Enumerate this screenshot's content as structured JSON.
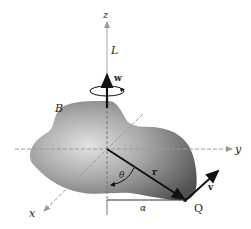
{
  "diagram": {
    "title": "",
    "body_label": "B",
    "axes": {
      "x": "x",
      "y": "y",
      "z": "z"
    },
    "vectors": {
      "angular_momentum": "L",
      "angular_velocity": "w",
      "position": "r",
      "velocity": "v"
    },
    "point_label": "Q",
    "angle_label": "θ",
    "distance_label": "α",
    "colors": {
      "body_dark": "#5a5a5a",
      "body_light": "#d8d8d8",
      "axis": "#9a9a9a",
      "vector": "#111111"
    }
  }
}
